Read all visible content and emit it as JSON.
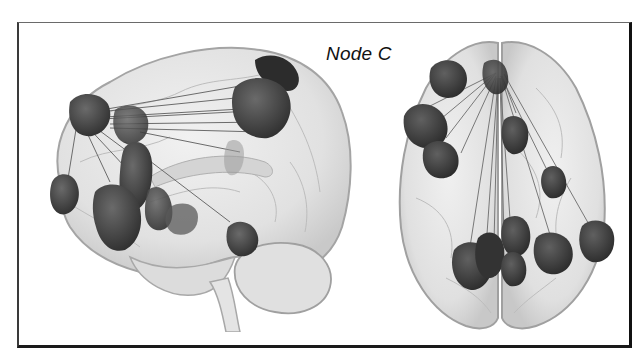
{
  "figure": {
    "panel_label": "Node C",
    "views": [
      {
        "name": "sagittal",
        "description": "Lateral (left-hemisphere) glass-brain view with highlighted nodes and connecting edges"
      },
      {
        "name": "axial",
        "description": "Top-down (superior) glass-brain view with highlighted nodes and connecting edges"
      }
    ],
    "colors": {
      "brain_fill": "#e4e4e4",
      "brain_edge": "#9a9a9a",
      "node_fill": "#4a4a4a",
      "node_dark": "#2e2e2e",
      "edge_line": "#6e6e6e",
      "frame": "#111111",
      "label": "#111111"
    }
  }
}
